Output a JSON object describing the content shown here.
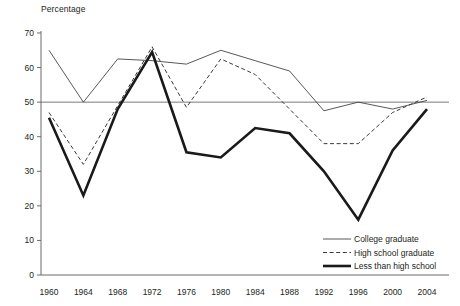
{
  "chart_data": {
    "type": "line",
    "title": "",
    "ylabel": "Percentage",
    "xlabel": "",
    "ylim": [
      0,
      70
    ],
    "yticks": [
      0,
      10,
      20,
      30,
      40,
      50,
      60,
      70
    ],
    "categories": [
      1960,
      1964,
      1968,
      1972,
      1976,
      1980,
      1984,
      1988,
      1992,
      1996,
      2000,
      2004
    ],
    "xtick_labels": [
      "1960",
      "1964",
      "1968",
      "1972",
      "1976",
      "1980",
      "1984",
      "1988",
      "1992",
      "1996",
      "2000",
      "2004"
    ],
    "grid": "single horizontal reference line at 50",
    "reference_line": 50,
    "legend_position": "bottom-right",
    "series": [
      {
        "name": "College graduate",
        "style": "thin-solid",
        "color": "#3a3a3a",
        "values": [
          65,
          50,
          62.5,
          62,
          61,
          65,
          62,
          59,
          47.5,
          50,
          48,
          50.5
        ]
      },
      {
        "name": "High school graduate",
        "style": "dashed",
        "color": "#3a3a3a",
        "values": [
          47,
          32,
          49,
          66,
          48.5,
          62.5,
          58,
          48,
          38,
          38,
          47,
          51.5
        ]
      },
      {
        "name": "Less than high school",
        "style": "thick-solid",
        "color": "#1a1a1a",
        "values": [
          45.5,
          23,
          48,
          64.5,
          35.5,
          34,
          42.5,
          41,
          30,
          16,
          36,
          48
        ]
      }
    ]
  },
  "legend": {
    "items": [
      {
        "label": "College graduate",
        "style": "thin-solid"
      },
      {
        "label": "High school graduate",
        "style": "dashed"
      },
      {
        "label": "Less than high school",
        "style": "thick-solid"
      }
    ]
  }
}
